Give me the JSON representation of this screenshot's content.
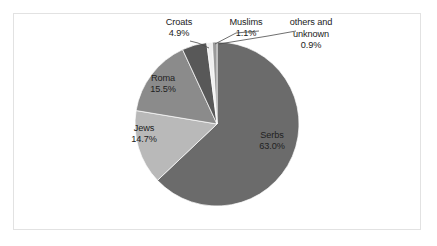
{
  "frame": {
    "border_color": "#e2e2e2",
    "background": "#ffffff"
  },
  "chart_data": {
    "type": "pie",
    "title": "",
    "subtitle": "",
    "xlabel": "",
    "ylabel": "",
    "grid": false,
    "legend_position": "none",
    "labels_position": "inside-and-callout",
    "start_angle_deg": 0,
    "direction": "clockwise",
    "categories": [
      "Serbs",
      "Jews",
      "Roma",
      "Croats",
      "Muslims",
      "others and unknown"
    ],
    "values": [
      63.0,
      14.7,
      15.5,
      4.9,
      1.1,
      0.9
    ],
    "value_labels": [
      "63.0%",
      "14.7%",
      "15.5%",
      "4.9%",
      "1.1%",
      "0.9%"
    ],
    "colors": [
      "#6b6b6b",
      "#b9b9b9",
      "#8b8b8b",
      "#585858",
      "#efefef",
      "#9a9a9a"
    ],
    "slices": [
      {
        "name": "Serbs",
        "value": 63.0,
        "value_label": "63.0%",
        "color": "#6b6b6b",
        "label_placement": "inside"
      },
      {
        "name": "Jews",
        "value": 14.7,
        "value_label": "14.7%",
        "color": "#b9b9b9",
        "label_placement": "inside"
      },
      {
        "name": "Roma",
        "value": 15.5,
        "value_label": "15.5%",
        "color": "#8b8b8b",
        "label_placement": "inside"
      },
      {
        "name": "Croats",
        "value": 4.9,
        "value_label": "4.9%",
        "color": "#585858",
        "label_placement": "callout"
      },
      {
        "name": "Muslims",
        "value": 1.1,
        "value_label": "1.1%",
        "color": "#efefef",
        "label_placement": "callout"
      },
      {
        "name": "others and unknown",
        "value": 0.9,
        "value_label": "0.9%",
        "color": "#9a9a9a",
        "label_placement": "callout"
      }
    ],
    "total": 100.1
  }
}
